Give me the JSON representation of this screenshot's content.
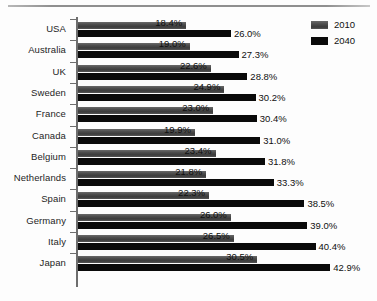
{
  "chart_data": {
    "type": "bar",
    "orientation": "horizontal",
    "title": "",
    "xlabel": "",
    "ylabel": "",
    "xlim": [
      0,
      45
    ],
    "grid": false,
    "legend_position": "top-right",
    "categories": [
      "USA",
      "Australia",
      "UK",
      "Sweden",
      "France",
      "Canada",
      "Belgium",
      "Netherlands",
      "Spain",
      "Germany",
      "Italy",
      "Japan"
    ],
    "series": [
      {
        "name": "2010",
        "color": "#4d4d4d",
        "values": [
          18.4,
          19.0,
          22.6,
          24.9,
          23.0,
          19.9,
          23.4,
          21.8,
          22.3,
          26.0,
          26.5,
          30.5
        ],
        "labels": [
          "18.4%",
          "19.0%",
          "22.6%",
          "24.9%",
          "23.0%",
          "19.9%",
          "23.4%",
          "21.8%",
          "22.3%",
          "26.0%",
          "26.5%",
          "30.5%"
        ]
      },
      {
        "name": "2040",
        "color": "#0a0a0a",
        "values": [
          26.0,
          27.3,
          28.8,
          30.2,
          30.4,
          31.0,
          31.8,
          33.3,
          38.5,
          39.0,
          40.4,
          42.9
        ],
        "labels": [
          "26.0%",
          "27.3%",
          "28.8%",
          "30.2%",
          "30.4%",
          "31.0%",
          "31.8%",
          "33.3%",
          "38.5%",
          "39.0%",
          "40.4%",
          "42.9%"
        ]
      }
    ]
  },
  "legend": {
    "items": [
      {
        "label": "2010",
        "color": "#4d4d4d"
      },
      {
        "label": "2040",
        "color": "#0a0a0a"
      }
    ]
  }
}
